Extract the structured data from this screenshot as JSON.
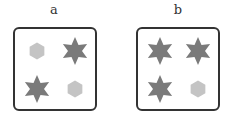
{
  "panels": [
    {
      "label": "a",
      "shapes": [
        "hexagon",
        "star",
        "star",
        "hexagon"
      ]
    },
    {
      "label": "b",
      "shapes": [
        "star",
        "star",
        "star",
        "hexagon"
      ]
    }
  ],
  "colors": {
    "star": "#7a7a7a",
    "hexagon": "#c4c4c4",
    "border": "#333333"
  }
}
